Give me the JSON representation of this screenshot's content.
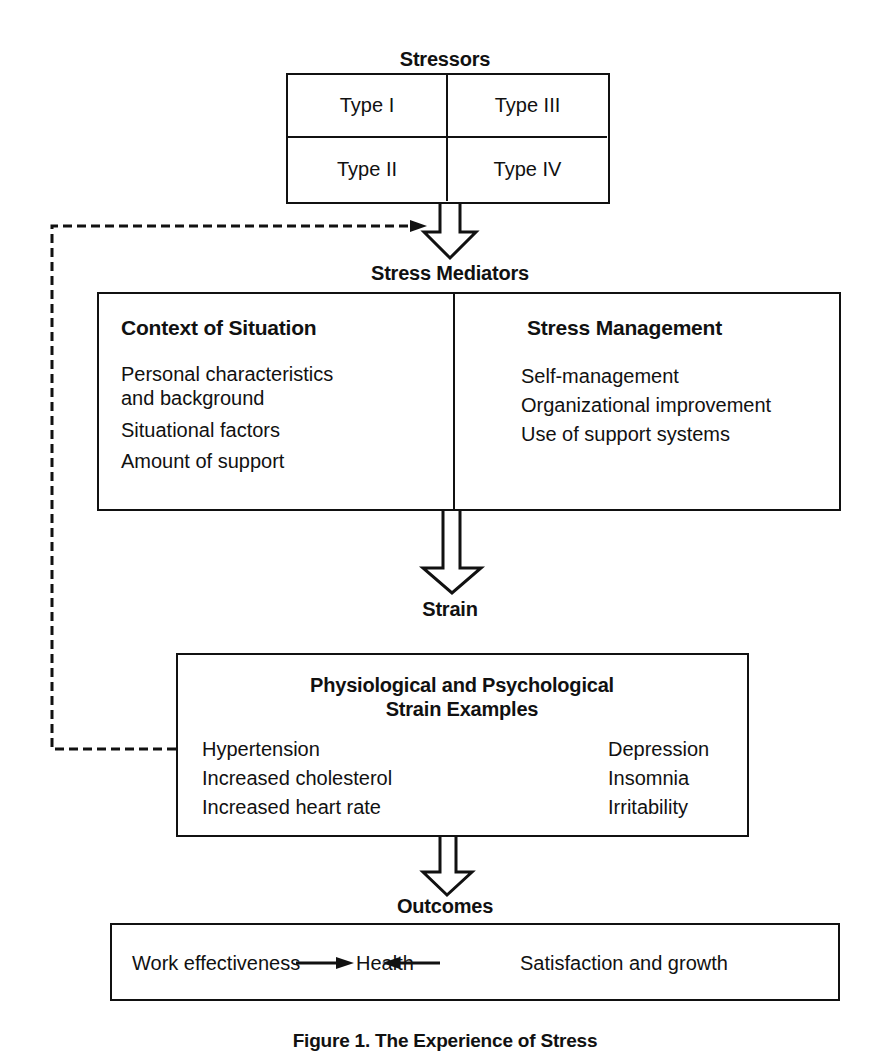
{
  "stressors": {
    "title": "Stressors",
    "types": [
      "Type I",
      "Type III",
      "Type II",
      "Type IV"
    ]
  },
  "mediators": {
    "title": "Stress Mediators",
    "context": {
      "heading": "Context of Situation",
      "items": [
        "Personal characteristics",
        "and background",
        "Situational factors",
        "Amount of support"
      ]
    },
    "management": {
      "heading": "Stress Management",
      "items": [
        "Self-management",
        "Organizational improvement",
        "Use of support systems"
      ]
    }
  },
  "strain": {
    "title": "Strain",
    "heading_line1": "Physiological and Psychological",
    "heading_line2": "Strain Examples",
    "physiological": [
      "Hypertension",
      "Increased cholesterol",
      "Increased heart rate"
    ],
    "psychological": [
      "Depression",
      "Insomnia",
      "Irritability"
    ]
  },
  "outcomes": {
    "title": "Outcomes",
    "left": "Work effectiveness",
    "center": "Health",
    "right": "Satisfaction and growth"
  },
  "caption": "Figure 1. The Experience of Stress"
}
